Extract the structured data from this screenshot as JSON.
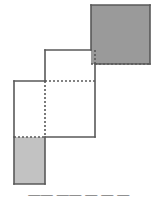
{
  "figure": {
    "colors": {
      "dark_gray_fill": "#9a9a9a",
      "light_gray_fill": "#c2c2c2",
      "white_fill": "#ffffff",
      "stroke": "#595959",
      "background": "#ffffff"
    },
    "stroke_width": 1.6,
    "dash_pattern": "2,2",
    "shapes": [
      {
        "name": "top-right-dark-square",
        "fill": "#9a9a9a",
        "x": 91,
        "y": 5,
        "width": 59,
        "height": 59,
        "label": "dark gray square, upper right"
      },
      {
        "name": "middle-white-square",
        "fill": "#ffffff",
        "x": 45,
        "y": 50,
        "width": 50,
        "height": 87,
        "label": "white region, middle"
      },
      {
        "name": "left-white-square",
        "fill": "#ffffff",
        "x": 14,
        "y": 81,
        "width": 81,
        "height": 56,
        "label": "white square, left"
      },
      {
        "name": "bottom-left-light-gray-rect",
        "fill": "#c2c2c2",
        "x": 14,
        "y": 137,
        "width": 31,
        "height": 47,
        "label": "light gray rectangle, bottom left"
      }
    ],
    "solid_edges": [
      {
        "name": "dark-square-top",
        "x1": 91,
        "y1": 5,
        "x2": 150,
        "y2": 5
      },
      {
        "name": "dark-square-right",
        "x1": 150,
        "y1": 5,
        "x2": 150,
        "y2": 64
      },
      {
        "name": "dark-square-bottom",
        "x1": 91,
        "y1": 64,
        "x2": 150,
        "y2": 64
      },
      {
        "name": "dark-square-left-upper",
        "x1": 91,
        "y1": 5,
        "x2": 91,
        "y2": 50
      },
      {
        "name": "middle-top",
        "x1": 45,
        "y1": 50,
        "x2": 91,
        "y2": 50
      },
      {
        "name": "middle-left-upper",
        "x1": 45,
        "y1": 50,
        "x2": 45,
        "y2": 81
      },
      {
        "name": "middle-right-lower",
        "x1": 95,
        "y1": 64,
        "x2": 95,
        "y2": 137
      },
      {
        "name": "middle-bottom",
        "x1": 45,
        "y1": 137,
        "x2": 95,
        "y2": 137
      },
      {
        "name": "left-square-top",
        "x1": 14,
        "y1": 81,
        "x2": 45,
        "y2": 81
      },
      {
        "name": "left-square-left",
        "x1": 14,
        "y1": 81,
        "x2": 14,
        "y2": 137
      },
      {
        "name": "light-rect-left",
        "x1": 14,
        "y1": 137,
        "x2": 14,
        "y2": 184
      },
      {
        "name": "light-rect-bottom",
        "x1": 14,
        "y1": 184,
        "x2": 45,
        "y2": 184
      },
      {
        "name": "light-rect-right",
        "x1": 45,
        "y1": 137,
        "x2": 45,
        "y2": 184
      }
    ],
    "dashed_edges": [
      {
        "name": "hidden-horizontal-through-dark-square",
        "x1": 91,
        "y1": 64,
        "x2": 150,
        "y2": 64
      },
      {
        "name": "hidden-vertical-in-dark-square",
        "x1": 95,
        "y1": 50,
        "x2": 95,
        "y2": 64
      },
      {
        "name": "hidden-horizontal-middle",
        "x1": 45,
        "y1": 81,
        "x2": 95,
        "y2": 81
      },
      {
        "name": "hidden-vertical-middle",
        "x1": 45,
        "y1": 81,
        "x2": 45,
        "y2": 137
      },
      {
        "name": "hidden-horizontal-bottom",
        "x1": 14,
        "y1": 137,
        "x2": 45,
        "y2": 137
      }
    ]
  },
  "caption": {
    "text": "——  ——  — — —",
    "note": "clipped text line at bottom edge"
  }
}
